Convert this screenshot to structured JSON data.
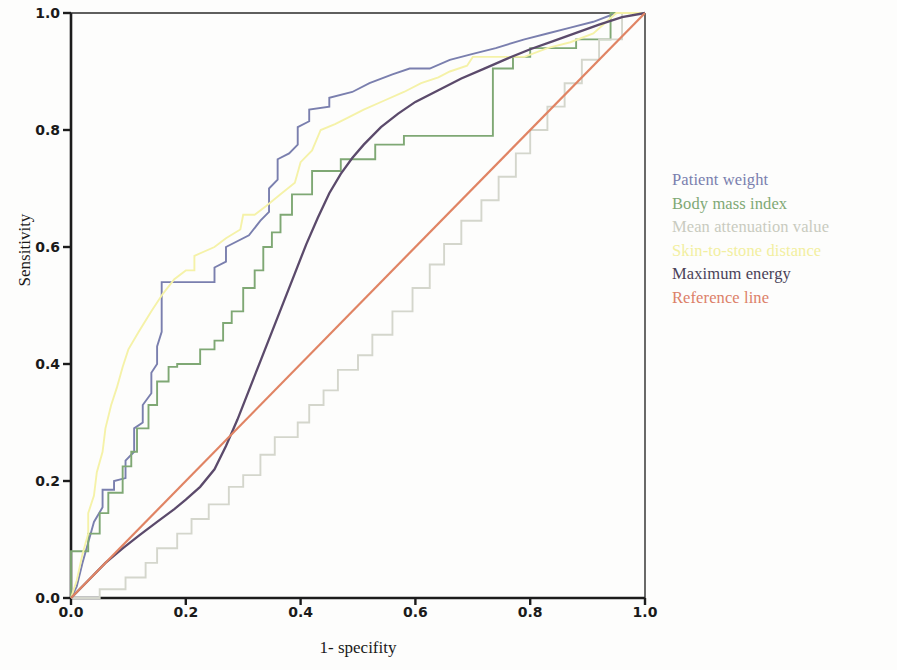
{
  "chart_data": {
    "type": "line",
    "title": "",
    "subtitle": "",
    "xlabel": "1- specifity",
    "ylabel": "Sensitivity",
    "xlim": [
      0.0,
      1.0
    ],
    "ylim": [
      0.0,
      1.0
    ],
    "xticks": [
      "0.0",
      "0.2",
      "0.4",
      "0.6",
      "0.8",
      "1.0"
    ],
    "xtick_values": [
      0.0,
      0.2,
      0.4,
      0.6,
      0.8,
      1.0
    ],
    "yticks": [
      "0.0",
      "0.2",
      "0.4",
      "0.6",
      "0.8",
      "1.0"
    ],
    "ytick_values": [
      0.0,
      0.2,
      0.4,
      0.6,
      0.8,
      1.0
    ],
    "grid": false,
    "legend_position": "right",
    "plot_style": "roc-curve-step",
    "series": [
      {
        "name": "Patient weight",
        "color": "#7a7fae",
        "style": "step",
        "points": [
          [
            0.0,
            0.0
          ],
          [
            0.01,
            0.02
          ],
          [
            0.02,
            0.06
          ],
          [
            0.03,
            0.095
          ],
          [
            0.04,
            0.13
          ],
          [
            0.055,
            0.155
          ],
          [
            0.055,
            0.185
          ],
          [
            0.075,
            0.185
          ],
          [
            0.075,
            0.2
          ],
          [
            0.095,
            0.205
          ],
          [
            0.095,
            0.235
          ],
          [
            0.11,
            0.25
          ],
          [
            0.11,
            0.29
          ],
          [
            0.125,
            0.3
          ],
          [
            0.125,
            0.33
          ],
          [
            0.14,
            0.35
          ],
          [
            0.14,
            0.385
          ],
          [
            0.15,
            0.4
          ],
          [
            0.15,
            0.43
          ],
          [
            0.158,
            0.455
          ],
          [
            0.158,
            0.54
          ],
          [
            0.25,
            0.54
          ],
          [
            0.25,
            0.565
          ],
          [
            0.27,
            0.575
          ],
          [
            0.27,
            0.6
          ],
          [
            0.31,
            0.62
          ],
          [
            0.33,
            0.645
          ],
          [
            0.345,
            0.66
          ],
          [
            0.345,
            0.7
          ],
          [
            0.36,
            0.715
          ],
          [
            0.36,
            0.75
          ],
          [
            0.38,
            0.76
          ],
          [
            0.395,
            0.775
          ],
          [
            0.395,
            0.805
          ],
          [
            0.415,
            0.815
          ],
          [
            0.415,
            0.835
          ],
          [
            0.45,
            0.84
          ],
          [
            0.45,
            0.855
          ],
          [
            0.49,
            0.865
          ],
          [
            0.52,
            0.88
          ],
          [
            0.56,
            0.895
          ],
          [
            0.59,
            0.905
          ],
          [
            0.625,
            0.905
          ],
          [
            0.66,
            0.92
          ],
          [
            0.7,
            0.93
          ],
          [
            0.74,
            0.94
          ],
          [
            0.79,
            0.955
          ],
          [
            0.83,
            0.965
          ],
          [
            0.87,
            0.975
          ],
          [
            0.91,
            0.985
          ],
          [
            0.95,
            1.0
          ],
          [
            1.0,
            1.0
          ]
        ]
      },
      {
        "name": "Body mass index",
        "color": "#7fa874",
        "style": "step",
        "points": [
          [
            0.0,
            0.0
          ],
          [
            0.0,
            0.08
          ],
          [
            0.03,
            0.08
          ],
          [
            0.03,
            0.11
          ],
          [
            0.05,
            0.11
          ],
          [
            0.05,
            0.145
          ],
          [
            0.065,
            0.145
          ],
          [
            0.065,
            0.18
          ],
          [
            0.09,
            0.18
          ],
          [
            0.09,
            0.225
          ],
          [
            0.105,
            0.225
          ],
          [
            0.105,
            0.25
          ],
          [
            0.115,
            0.25
          ],
          [
            0.115,
            0.29
          ],
          [
            0.135,
            0.29
          ],
          [
            0.135,
            0.33
          ],
          [
            0.15,
            0.33
          ],
          [
            0.15,
            0.37
          ],
          [
            0.17,
            0.37
          ],
          [
            0.17,
            0.395
          ],
          [
            0.185,
            0.395
          ],
          [
            0.185,
            0.4
          ],
          [
            0.225,
            0.4
          ],
          [
            0.225,
            0.425
          ],
          [
            0.25,
            0.425
          ],
          [
            0.25,
            0.44
          ],
          [
            0.265,
            0.44
          ],
          [
            0.265,
            0.47
          ],
          [
            0.28,
            0.47
          ],
          [
            0.28,
            0.49
          ],
          [
            0.3,
            0.49
          ],
          [
            0.3,
            0.53
          ],
          [
            0.32,
            0.53
          ],
          [
            0.32,
            0.56
          ],
          [
            0.335,
            0.56
          ],
          [
            0.335,
            0.6
          ],
          [
            0.35,
            0.6
          ],
          [
            0.35,
            0.625
          ],
          [
            0.365,
            0.625
          ],
          [
            0.365,
            0.655
          ],
          [
            0.385,
            0.655
          ],
          [
            0.385,
            0.69
          ],
          [
            0.42,
            0.69
          ],
          [
            0.42,
            0.73
          ],
          [
            0.47,
            0.73
          ],
          [
            0.47,
            0.75
          ],
          [
            0.53,
            0.75
          ],
          [
            0.53,
            0.775
          ],
          [
            0.58,
            0.775
          ],
          [
            0.58,
            0.79
          ],
          [
            0.735,
            0.79
          ],
          [
            0.735,
            0.905
          ],
          [
            0.77,
            0.905
          ],
          [
            0.77,
            0.925
          ],
          [
            0.8,
            0.925
          ],
          [
            0.8,
            0.94
          ],
          [
            0.88,
            0.94
          ],
          [
            0.88,
            0.955
          ],
          [
            0.94,
            0.955
          ],
          [
            0.94,
            1.0
          ],
          [
            1.0,
            1.0
          ]
        ]
      },
      {
        "name": "Mean attenuation value",
        "color": "#d4d6cc",
        "style": "step",
        "points": [
          [
            0.0,
            0.0
          ],
          [
            0.05,
            0.0
          ],
          [
            0.05,
            0.015
          ],
          [
            0.095,
            0.015
          ],
          [
            0.095,
            0.035
          ],
          [
            0.13,
            0.035
          ],
          [
            0.13,
            0.06
          ],
          [
            0.15,
            0.06
          ],
          [
            0.15,
            0.085
          ],
          [
            0.185,
            0.085
          ],
          [
            0.185,
            0.11
          ],
          [
            0.21,
            0.11
          ],
          [
            0.21,
            0.135
          ],
          [
            0.24,
            0.135
          ],
          [
            0.24,
            0.16
          ],
          [
            0.275,
            0.16
          ],
          [
            0.275,
            0.19
          ],
          [
            0.3,
            0.19
          ],
          [
            0.3,
            0.21
          ],
          [
            0.33,
            0.21
          ],
          [
            0.33,
            0.245
          ],
          [
            0.355,
            0.245
          ],
          [
            0.355,
            0.275
          ],
          [
            0.395,
            0.275
          ],
          [
            0.395,
            0.3
          ],
          [
            0.415,
            0.3
          ],
          [
            0.415,
            0.33
          ],
          [
            0.44,
            0.33
          ],
          [
            0.44,
            0.355
          ],
          [
            0.465,
            0.355
          ],
          [
            0.465,
            0.39
          ],
          [
            0.5,
            0.39
          ],
          [
            0.5,
            0.415
          ],
          [
            0.525,
            0.415
          ],
          [
            0.525,
            0.45
          ],
          [
            0.56,
            0.45
          ],
          [
            0.56,
            0.49
          ],
          [
            0.595,
            0.49
          ],
          [
            0.595,
            0.53
          ],
          [
            0.625,
            0.53
          ],
          [
            0.625,
            0.57
          ],
          [
            0.65,
            0.57
          ],
          [
            0.65,
            0.605
          ],
          [
            0.68,
            0.605
          ],
          [
            0.68,
            0.645
          ],
          [
            0.715,
            0.645
          ],
          [
            0.715,
            0.68
          ],
          [
            0.745,
            0.68
          ],
          [
            0.745,
            0.72
          ],
          [
            0.775,
            0.72
          ],
          [
            0.775,
            0.76
          ],
          [
            0.8,
            0.76
          ],
          [
            0.8,
            0.8
          ],
          [
            0.83,
            0.8
          ],
          [
            0.83,
            0.84
          ],
          [
            0.86,
            0.84
          ],
          [
            0.86,
            0.88
          ],
          [
            0.89,
            0.88
          ],
          [
            0.89,
            0.92
          ],
          [
            0.92,
            0.92
          ],
          [
            0.92,
            0.955
          ],
          [
            0.96,
            0.955
          ],
          [
            0.96,
            1.0
          ],
          [
            1.0,
            1.0
          ]
        ]
      },
      {
        "name": "Skin-to-stone distance",
        "color": "#f5f2a8",
        "style": "step",
        "points": [
          [
            0.0,
            0.0
          ],
          [
            0.01,
            0.03
          ],
          [
            0.02,
            0.075
          ],
          [
            0.03,
            0.11
          ],
          [
            0.03,
            0.145
          ],
          [
            0.04,
            0.175
          ],
          [
            0.045,
            0.215
          ],
          [
            0.055,
            0.25
          ],
          [
            0.06,
            0.29
          ],
          [
            0.07,
            0.33
          ],
          [
            0.08,
            0.36
          ],
          [
            0.09,
            0.395
          ],
          [
            0.1,
            0.425
          ],
          [
            0.118,
            0.455
          ],
          [
            0.14,
            0.49
          ],
          [
            0.16,
            0.52
          ],
          [
            0.18,
            0.545
          ],
          [
            0.2,
            0.56
          ],
          [
            0.215,
            0.56
          ],
          [
            0.215,
            0.585
          ],
          [
            0.25,
            0.6
          ],
          [
            0.27,
            0.615
          ],
          [
            0.295,
            0.63
          ],
          [
            0.3,
            0.655
          ],
          [
            0.32,
            0.655
          ],
          [
            0.34,
            0.67
          ],
          [
            0.365,
            0.69
          ],
          [
            0.39,
            0.71
          ],
          [
            0.4,
            0.745
          ],
          [
            0.42,
            0.765
          ],
          [
            0.435,
            0.8
          ],
          [
            0.46,
            0.81
          ],
          [
            0.48,
            0.82
          ],
          [
            0.51,
            0.835
          ],
          [
            0.545,
            0.85
          ],
          [
            0.58,
            0.865
          ],
          [
            0.61,
            0.88
          ],
          [
            0.64,
            0.89
          ],
          [
            0.66,
            0.9
          ],
          [
            0.69,
            0.91
          ],
          [
            0.7,
            0.925
          ],
          [
            0.79,
            0.925
          ],
          [
            0.83,
            0.94
          ],
          [
            0.87,
            0.95
          ],
          [
            0.91,
            0.965
          ],
          [
            0.95,
            1.0
          ],
          [
            1.0,
            1.0
          ]
        ]
      },
      {
        "name": "Maximum energy",
        "color": "#5b4a6b",
        "style": "smooth",
        "points": [
          [
            0.0,
            0.0
          ],
          [
            0.03,
            0.03
          ],
          [
            0.06,
            0.06
          ],
          [
            0.09,
            0.085
          ],
          [
            0.12,
            0.108
          ],
          [
            0.15,
            0.13
          ],
          [
            0.18,
            0.152
          ],
          [
            0.2,
            0.168
          ],
          [
            0.225,
            0.19
          ],
          [
            0.25,
            0.22
          ],
          [
            0.27,
            0.26
          ],
          [
            0.29,
            0.305
          ],
          [
            0.31,
            0.355
          ],
          [
            0.33,
            0.405
          ],
          [
            0.35,
            0.455
          ],
          [
            0.37,
            0.505
          ],
          [
            0.39,
            0.555
          ],
          [
            0.41,
            0.605
          ],
          [
            0.43,
            0.65
          ],
          [
            0.45,
            0.692
          ],
          [
            0.47,
            0.725
          ],
          [
            0.49,
            0.752
          ],
          [
            0.51,
            0.775
          ],
          [
            0.54,
            0.805
          ],
          [
            0.57,
            0.828
          ],
          [
            0.6,
            0.848
          ],
          [
            0.64,
            0.868
          ],
          [
            0.68,
            0.888
          ],
          [
            0.72,
            0.905
          ],
          [
            0.76,
            0.922
          ],
          [
            0.8,
            0.938
          ],
          [
            0.84,
            0.952
          ],
          [
            0.88,
            0.966
          ],
          [
            0.92,
            0.98
          ],
          [
            0.96,
            0.993
          ],
          [
            1.0,
            1.0
          ]
        ]
      },
      {
        "name": "Reference line",
        "color": "#e08464",
        "style": "diagonal",
        "points": [
          [
            0.0,
            0.0
          ],
          [
            1.0,
            1.0
          ]
        ]
      }
    ]
  },
  "axes": {
    "x_title": "1- specifity",
    "y_title": "Sensitivity",
    "x_tick_labels": [
      "0.0",
      "0.2",
      "0.4",
      "0.6",
      "0.8",
      "1.0"
    ],
    "y_tick_labels": [
      "0.0",
      "0.2",
      "0.4",
      "0.6",
      "0.8",
      "1.0"
    ]
  },
  "legend": {
    "items": [
      {
        "label": "Patient weight",
        "color": "#7a7fae"
      },
      {
        "label": "Body mass index",
        "color": "#7fa874"
      },
      {
        "label": "Mean attenuation value",
        "color": "#c9cbbf"
      },
      {
        "label": "Skin-to-stone distance",
        "color": "#f2efa0"
      },
      {
        "label": "Maximum energy",
        "color": "#4a4258"
      },
      {
        "label": "Reference line",
        "color": "#dc8068"
      }
    ]
  }
}
